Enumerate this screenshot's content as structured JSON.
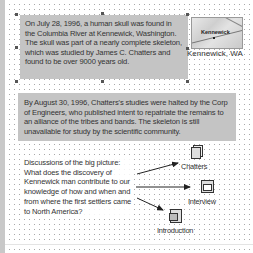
{
  "slide": {
    "paragraph1": "On July 28, 1996, a human skull was found in the Columbia River at Kennewick, Washington. The skull was part of a nearly complete skeleton, which was studied by James C. Chatters and found to be over 9000 years old.",
    "paragraph2": "By August 30, 1996, Chatters's studies were halted by the Corp of Engineers, who published intent to repatriate the remains to an alliance of the tribes and bands. The skeleton is still unavailable for study by the scientific community.",
    "question": "Discussions of the big picture: What does the discovery of Kennewick man contribute to our knowledge of how and when and from where the first settlers came to North America?",
    "map": {
      "label": "Kennewick",
      "caption": "Kennewick, WA",
      "icon": "map-image"
    },
    "links": [
      {
        "label": "Chatters",
        "icon": "document-stack-icon"
      },
      {
        "label": "Interview",
        "icon": "window-document-icon"
      },
      {
        "label": "Introduction",
        "icon": "presentation-document-icon"
      }
    ]
  },
  "colors": {
    "textbox_fill": "#c4c4c4",
    "grid_dot": "#a9a9a9",
    "text": "#333333"
  }
}
